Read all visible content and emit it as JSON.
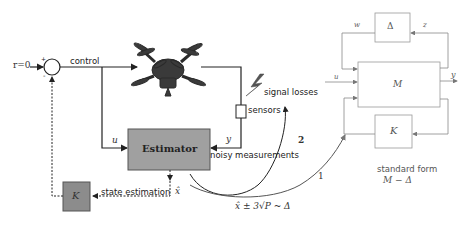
{
  "control_loop": {
    "reference_label": "r=0",
    "sum_plus": "+",
    "sum_minus": "-",
    "control_label": "control",
    "plant": "quadcopter-drone",
    "signal_losses_label": "signal losses",
    "sensors_label": "sensors",
    "estimator_label": "Estimator",
    "u_label": "u",
    "y_label": "y",
    "noisy_measurements_label": "noisy measurements",
    "state_estimation_label": "state estimation",
    "xhat_label": "x̂",
    "controller_label": "K"
  },
  "uncertainty": {
    "expression": "x̂ ± 3√P ~ Δ",
    "arc_1_label": "1",
    "arc_2_label": "2"
  },
  "standard_form": {
    "delta_label": "Δ",
    "w_label": "w",
    "z_label": "z",
    "u_label": "u",
    "y_label": "y",
    "m_label": "M",
    "k_label": "K",
    "caption_line1": "standard form",
    "caption_line2": "M − Δ"
  },
  "colors": {
    "estimator_fill": "#a0a0a0",
    "controller_fill": "#8c8c8c",
    "line_dark": "#222222",
    "line_light": "#888888"
  }
}
